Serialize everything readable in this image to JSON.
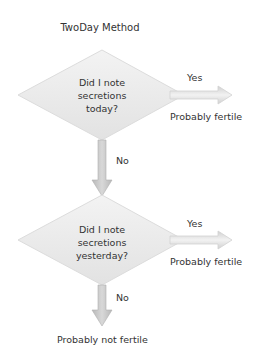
{
  "diagram": {
    "title": "TwoDay Method",
    "nodes": [
      {
        "question": [
          "Did I note",
          "secretions",
          "today?"
        ],
        "yes_label": "Yes",
        "yes_outcome": "Probably fertile",
        "no_label": "No"
      },
      {
        "question": [
          "Did I note",
          "secretions",
          "yesterday?"
        ],
        "yes_label": "Yes",
        "yes_outcome": "Probably fertile",
        "no_label": "No",
        "no_outcome": "Probably not fertile"
      }
    ],
    "colors": {
      "diamond_fill": "#e9e9e9",
      "arrow_fill": "#c8c8c8",
      "text": "#333333"
    }
  }
}
